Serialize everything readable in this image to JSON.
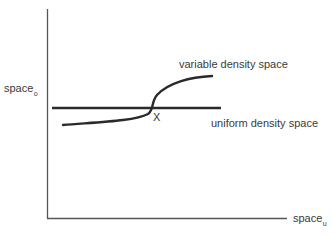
{
  "diagram": {
    "y_axis": {
      "label": "space",
      "subscript": "o"
    },
    "x_axis": {
      "label": "space",
      "subscript": "u"
    },
    "curves": {
      "variable": {
        "label": "variable density space"
      },
      "uniform": {
        "label": "uniform density space"
      }
    },
    "intersection": {
      "label": "X"
    },
    "colors": {
      "line": "#2a2a2a",
      "axis": "#555555",
      "text": "#3a3a3a"
    }
  }
}
